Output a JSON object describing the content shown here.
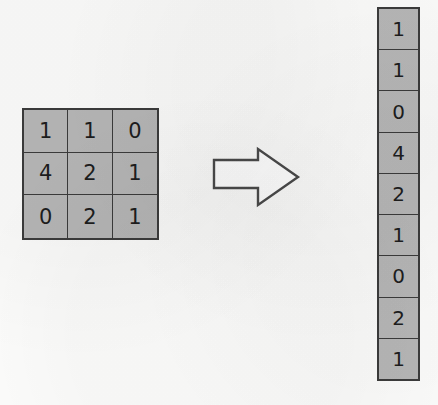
{
  "figure": {
    "background_color": "#fbfbfa",
    "cell_fill_color": "#b6b6b6",
    "line_color": "#3b3b3b",
    "text_color": "#1d1d1d"
  },
  "matrix": {
    "name": "input-matrix",
    "rows": 3,
    "cols": 3,
    "values": [
      [
        "1",
        "1",
        "0"
      ],
      [
        "4",
        "2",
        "1"
      ],
      [
        "0",
        "2",
        "1"
      ]
    ]
  },
  "arrow": {
    "name": "right-arrow-icon",
    "direction": "right",
    "fill": "#ffffff",
    "stroke": "#4a4a4a"
  },
  "vector": {
    "name": "output-column-vector",
    "rows": 9,
    "cols": 1,
    "values": [
      "1",
      "1",
      "0",
      "4",
      "2",
      "1",
      "0",
      "2",
      "1"
    ]
  }
}
